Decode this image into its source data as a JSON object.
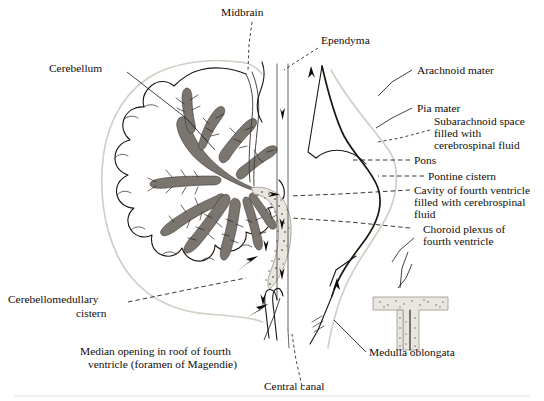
{
  "figure": {
    "title": "Sagittal section of cerebellum, pons and medulla showing cerebrospinal fluid circulation",
    "background_color": "#ffffff",
    "ink_color": "#17120f",
    "arbor_fill": "#7b7570",
    "arachnoid_color": "#d2cec6",
    "plexus_fill": "#e9e6e0"
  },
  "labels": {
    "midbrain": "Midbrain",
    "ependyma": "Ependyma",
    "cerebellum": "Cerebellum",
    "arachnoid_mater": "Arachnoid mater",
    "pia_mater": "Pia mater",
    "subarachnoid_space_1": "Subarachnoid space",
    "subarachnoid_space_2": "filled with",
    "subarachnoid_space_3": "cerebrospinal fluid",
    "pons": "Pons",
    "pontine_cistern": "Pontine cistern",
    "cavity_fourth_ventricle_1": "Cavity of fourth ventricle",
    "cavity_fourth_ventricle_2": "filled with cerebrospinal",
    "cavity_fourth_ventricle_3": "fluid",
    "choroid_plexus_1": "Choroid plexus of",
    "choroid_plexus_2": "fourth ventricle",
    "cerebellomedullary_1": "Cerebellomedullary",
    "cerebellomedullary_2": "cistern",
    "median_opening_1": "Median opening in roof of fourth",
    "median_opening_2": "ventricle (foramen of Magendie)",
    "central_canal": "Central canal",
    "medulla_oblongata": "Medulla oblongata"
  }
}
